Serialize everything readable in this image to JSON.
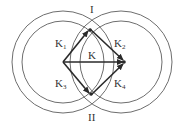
{
  "diagram": {
    "title": "",
    "circles": [
      {
        "id": "left-outer",
        "cx": 63,
        "cy": 62,
        "r": 51
      },
      {
        "id": "left-inner",
        "cx": 63,
        "cy": 62,
        "r": 41
      },
      {
        "id": "right-outer",
        "cx": 121,
        "cy": 62,
        "r": 51
      },
      {
        "id": "right-inner",
        "cx": 121,
        "cy": 62,
        "r": 41
      }
    ],
    "vertices": {
      "left": {
        "x": 63,
        "y": 62
      },
      "top": {
        "x": 90,
        "y": 29
      },
      "right": {
        "x": 125,
        "y": 62
      },
      "bottom": {
        "x": 91,
        "y": 95
      }
    },
    "labels": {
      "top_intersection": "I",
      "bottom_intersection": "II",
      "k1": {
        "main": "K",
        "sub": "1"
      },
      "k2": {
        "main": "K",
        "sub": "2"
      },
      "k3": {
        "main": "K",
        "sub": "3"
      },
      "k4": {
        "main": "K",
        "sub": "4"
      },
      "k": "K"
    },
    "colors": {
      "circle_stroke": "#6e6e6e",
      "edge_stroke": "#2a2a2a",
      "text": "#333333"
    }
  }
}
